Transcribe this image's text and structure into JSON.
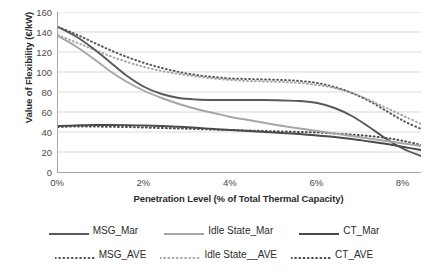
{
  "chart_data": {
    "type": "line",
    "title": "",
    "xlabel": "Penetration Level (% of Total Thermal Capacity)",
    "ylabel": "Value of Flexibility (€/kW)",
    "xlim": [
      0,
      8.4
    ],
    "ylim": [
      0,
      160
    ],
    "grid": true,
    "legend_position": "bottom",
    "x_tick_labels": [
      "0%",
      "2%",
      "4%",
      "6%",
      "8%"
    ],
    "x_tick_values": [
      0,
      2,
      4,
      6,
      8
    ],
    "y_tick_labels": [
      "0",
      "20",
      "40",
      "60",
      "80",
      "100",
      "120",
      "140",
      "160"
    ],
    "y_tick_values": [
      0,
      20,
      40,
      60,
      80,
      100,
      120,
      140,
      160
    ],
    "x": [
      0,
      0.4,
      0.8,
      1.2,
      1.6,
      2.0,
      2.4,
      2.8,
      3.2,
      3.6,
      4.0,
      4.4,
      4.8,
      5.2,
      5.6,
      6.0,
      6.4,
      6.8,
      7.2,
      7.6,
      8.0,
      8.4
    ],
    "series": [
      {
        "name": "MSG_Mar",
        "style": "solid",
        "color": "#595959",
        "values": [
          145,
          136,
          124,
          110,
          96,
          85,
          78,
          74,
          72.5,
          72,
          72,
          72,
          72,
          71.5,
          71,
          69,
          64,
          56,
          45,
          33,
          23,
          16
        ]
      },
      {
        "name": "Idle State_Mar",
        "style": "solid",
        "color": "#a6a6a6",
        "values": [
          136,
          126,
          114,
          101,
          90,
          81,
          74,
          68,
          63,
          59,
          55,
          52,
          49,
          46,
          43.5,
          41,
          38.5,
          36,
          33.5,
          31,
          28.5,
          26
        ]
      },
      {
        "name": "CT_Mar",
        "style": "solid",
        "color": "#4a4a4a",
        "values": [
          46,
          46.5,
          47,
          47,
          46.8,
          46.5,
          46,
          45.2,
          44.2,
          43,
          42,
          41,
          40,
          39,
          38,
          36.5,
          35,
          33,
          30.5,
          28,
          25,
          22
        ]
      },
      {
        "name": "MSG_AVE",
        "style": "dotted",
        "color": "#595959",
        "values": [
          145,
          138,
          130,
          122,
          115,
          109,
          104,
          100,
          97,
          95,
          93.5,
          93,
          92.5,
          92,
          91,
          89,
          85,
          79,
          71,
          61,
          51,
          43
        ]
      },
      {
        "name": "Idle State__AVE",
        "style": "dotted",
        "color": "#a6a6a6",
        "values": [
          137,
          130,
          123,
          116,
          110,
          105,
          101,
          98,
          95.5,
          93.5,
          92,
          91,
          90.5,
          90,
          89,
          87,
          84,
          79,
          72,
          64,
          56,
          48
        ]
      },
      {
        "name": "CT_AVE",
        "style": "dotted",
        "color": "#4a4a4a",
        "values": [
          45,
          45.5,
          45.5,
          45.2,
          45,
          44.5,
          44,
          43.5,
          43,
          42.5,
          42,
          41.5,
          41,
          40.5,
          40,
          39.5,
          38.5,
          37.5,
          36,
          34,
          31,
          27
        ]
      }
    ]
  },
  "legend": {
    "row1": [
      {
        "label": "MSG_Mar",
        "style": "solid",
        "color": "#595959"
      },
      {
        "label": "Idle State_Mar",
        "style": "solid",
        "color": "#a6a6a6"
      },
      {
        "label": "CT_Mar",
        "style": "solid",
        "color": "#4a4a4a"
      }
    ],
    "row2": [
      {
        "label": "MSG_AVE",
        "style": "dotted",
        "color": "#595959"
      },
      {
        "label": "Idle State__AVE",
        "style": "dotted",
        "color": "#a6a6a6"
      },
      {
        "label": "CT_AVE",
        "style": "dotted",
        "color": "#4a4a4a"
      }
    ]
  }
}
